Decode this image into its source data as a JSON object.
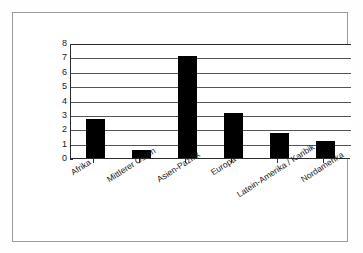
{
  "chart_data": {
    "type": "bar",
    "title": "",
    "xlabel": "",
    "ylabel": "Mio. Beschäftigte",
    "categories": [
      "Afrika",
      "Mittlerer Osten",
      "Asien-Pazifik",
      "Europa",
      "Latein-Amerika / Karibik",
      "Nordamerika"
    ],
    "values": [
      2.7,
      0.55,
      7.1,
      3.1,
      1.75,
      1.15
    ],
    "ylim": [
      0,
      8
    ],
    "yticks": [
      0,
      1,
      2,
      3,
      4,
      5,
      6,
      7,
      8
    ],
    "ytick_labels": [
      "0",
      "1",
      "2",
      "3",
      "4",
      "5",
      "6",
      "7",
      "8"
    ],
    "grid": true,
    "grid_axis": "y",
    "legend": false,
    "bar_color": "#000000",
    "axis_color": "#2b2b2b",
    "grid_color": "#555555",
    "frame_color": "#9a9a9a",
    "background_color": "#ffffff"
  }
}
